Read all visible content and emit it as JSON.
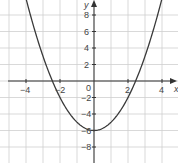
{
  "chart_data": {
    "type": "line",
    "title": "",
    "function": "y = x^2 - 6",
    "xlabel": "x",
    "ylabel": "y",
    "xlim": [
      -5.5,
      4.9
    ],
    "ylim": [
      -9.8,
      9.8
    ],
    "grid": true,
    "x_ticks": [
      -4,
      -2,
      2,
      4
    ],
    "y_ticks": [
      8,
      6,
      4,
      2,
      -2,
      -4,
      -6,
      -8
    ],
    "origin_label": "0",
    "series": [
      {
        "name": "parabola",
        "x": [
          -3.9,
          -3,
          -2.45,
          -2,
          -1,
          0,
          1,
          2,
          2.45,
          3,
          3.9
        ],
        "y": [
          9.21,
          3,
          0,
          -2,
          -5,
          -6,
          -5,
          -2,
          0,
          3,
          9.21
        ]
      }
    ],
    "vertex": [
      0,
      -6
    ],
    "roots": [
      -2.45,
      2.45
    ]
  },
  "labels": {
    "x_axis": "x",
    "y_axis": "y",
    "origin": "0",
    "xt_m4": "−4",
    "xt_m2": "−2",
    "xt_2": "2",
    "xt_4": "4",
    "yt_8": "8",
    "yt_6": "6",
    "yt_4": "4",
    "yt_2": "2",
    "yt_m2": "−2",
    "yt_m4": "−4",
    "yt_m6": "−6",
    "yt_m8": "−8"
  },
  "colors": {
    "grid": "#cfcfcf",
    "axis": "#333333",
    "curve": "#3a3a3a"
  }
}
